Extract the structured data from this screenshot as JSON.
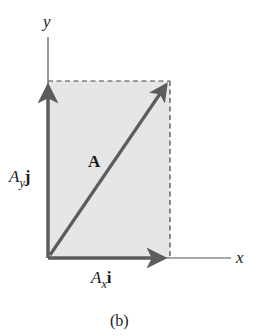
{
  "figure": {
    "caption": "(b)",
    "colors": {
      "background": "#ffffff",
      "rect_fill": "#e6e6e6",
      "vector": "#5c5c5c",
      "axis": "#555555",
      "dashed": "#444444",
      "text": "#1a1a1a"
    },
    "axes": {
      "x_label": "x",
      "y_label": "y"
    },
    "vectors": [
      {
        "name": "A",
        "label": "A",
        "bold": true,
        "from": [
          0,
          0
        ],
        "to": [
          1,
          1
        ]
      },
      {
        "name": "Ax_i",
        "label_main": "A",
        "label_sub": "x",
        "label_unit": "i",
        "from": [
          0,
          0
        ],
        "to": [
          1,
          0
        ]
      },
      {
        "name": "Ay_j",
        "label_main": "A",
        "label_sub": "y",
        "label_unit": "j",
        "from": [
          0,
          0
        ],
        "to": [
          0,
          1
        ]
      }
    ],
    "labels": {
      "resultant": "A",
      "x_component_main": "A",
      "x_component_sub": "x",
      "x_component_unit": "i",
      "y_component_main": "A",
      "y_component_sub": "y",
      "y_component_unit": "j"
    }
  }
}
